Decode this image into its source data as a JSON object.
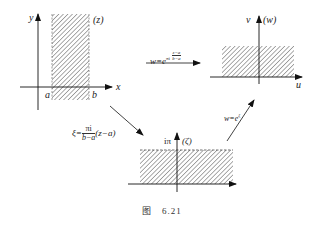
{
  "figure": {
    "caption_prefix": "图",
    "caption_number": "6.21",
    "z_plane": {
      "label": "(z)",
      "y_axis": "y",
      "x_axis": "x",
      "a_label": "a",
      "b_label": "b",
      "region": "vertical strip a < x < b, hatched"
    },
    "w_plane": {
      "label": "(w)",
      "v_axis": "v",
      "u_axis": "u",
      "region": "upper half-plane, hatched"
    },
    "zeta_plane": {
      "label": "(ζ)",
      "height_label": "iπ",
      "region": "horizontal strip 0 < Im ζ < π, hatched, dashed top boundary"
    },
    "map_z_to_w": {
      "lhs": "w=e",
      "exp_prefix": "πi",
      "exp_num": "z−a",
      "exp_den": "b−a"
    },
    "map_z_to_zeta": {
      "lhs": "ξ=",
      "num": "πi",
      "den": "b−a",
      "rhs": "(z−a)"
    },
    "map_zeta_to_w": {
      "lhs": "w=e",
      "exp": "ξ"
    }
  }
}
